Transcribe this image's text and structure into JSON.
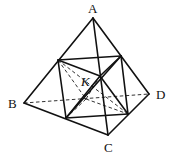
{
  "diagram": {
    "type": "geometry",
    "labels": {
      "A": "A",
      "B": "B",
      "C": "C",
      "D": "D",
      "K": "K"
    },
    "vertices": {
      "A": [
        93,
        18
      ],
      "B": [
        24,
        103
      ],
      "C": [
        108,
        135
      ],
      "D": [
        149,
        94
      ]
    },
    "midpoints": {
      "AB": [
        58,
        60
      ],
      "AC": [
        100,
        76
      ],
      "AD": [
        121,
        56
      ],
      "BC": [
        66,
        118
      ],
      "BD": [
        86,
        99
      ],
      "CD": [
        128,
        114
      ]
    },
    "colors": {
      "line": "#111111",
      "dashed": "#333333",
      "background": "#ffffff"
    }
  }
}
